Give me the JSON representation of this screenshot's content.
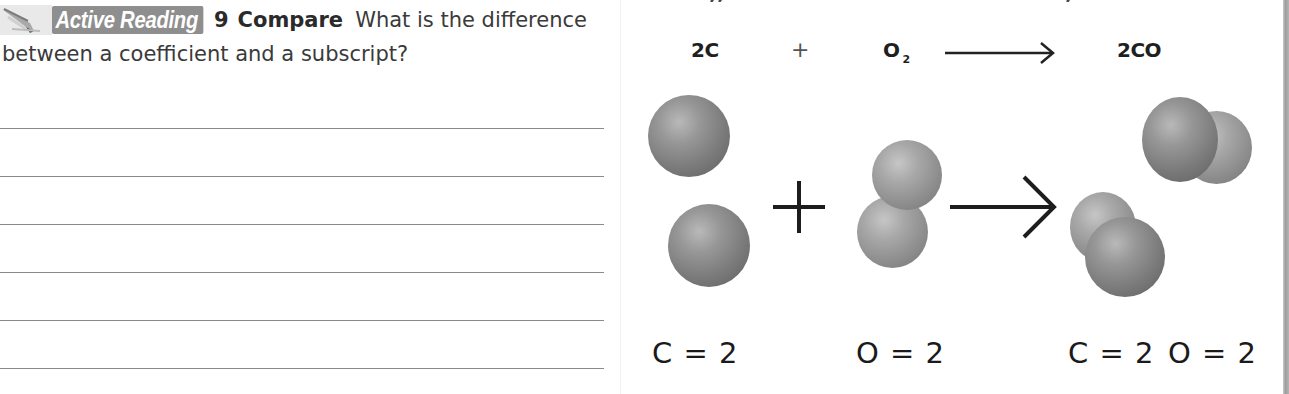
{
  "question": {
    "badge_label": "Active Reading",
    "badge_icon": "pencil-icon",
    "number": "9",
    "keyword": "Compare",
    "text_line1": "What is the difference",
    "text_line2": "between a coefficient and a subscript?",
    "answer_lines": 6
  },
  "equation": {
    "reactant1": "2C",
    "plus": "+",
    "reactant2_base": "O",
    "reactant2_subscript": "2",
    "arrow_icon": "long-right-arrow-icon",
    "product": "2CO"
  },
  "model": {
    "plus_icon": "plus-icon",
    "arrow_icon": "right-arrow-icon",
    "reactant1_atoms": [
      "C",
      "C"
    ],
    "reactant2_molecule": [
      "O",
      "O"
    ],
    "product_molecules": [
      [
        "C",
        "O"
      ],
      [
        "C",
        "O"
      ]
    ],
    "colors": {
      "carbon": "#7e7e7e",
      "oxygen": "#9a9a9a",
      "badge": "#8e8e8e"
    }
  },
  "atom_counts": {
    "reactant1": "C = 2",
    "reactant2": "O = 2",
    "product_carbon": "C = 2",
    "product_oxygen": "O = 2"
  }
}
